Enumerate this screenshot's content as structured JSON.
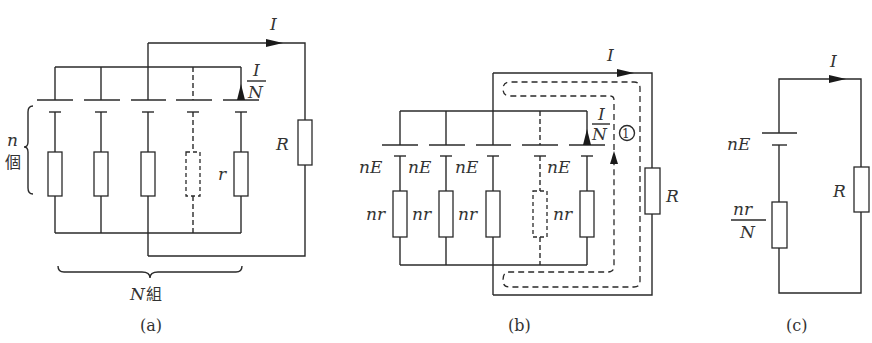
{
  "figure": {
    "panels": [
      {
        "id": "a",
        "caption": "(a)",
        "current_total": "I",
        "branch_current_num": "I",
        "branch_current_den": "N",
        "resistor_label": "r",
        "load_label": "R",
        "series_count_var": "n",
        "series_count_unit": "個",
        "group_count_var": "N",
        "group_count_unit": "組"
      },
      {
        "id": "b",
        "caption": "(b)",
        "current_total": "I",
        "branch_current_num": "I",
        "branch_current_den": "N",
        "loop_marker": "①",
        "emf_label": "nE",
        "internal_resistance_label": "nr",
        "load_label": "R",
        "emf_labels": [
          "nE",
          "nE",
          "nE",
          "nE"
        ],
        "resistance_labels": [
          "nr",
          "nr",
          "nr",
          "nr"
        ]
      },
      {
        "id": "c",
        "caption": "(c)",
        "current_total": "I",
        "emf_label": "nE",
        "equiv_resistance_num": "nr",
        "equiv_resistance_den": "N",
        "load_label": "R"
      }
    ],
    "colors": {
      "line": "#2a2a2a",
      "text": "#333333",
      "background": "#ffffff"
    }
  }
}
